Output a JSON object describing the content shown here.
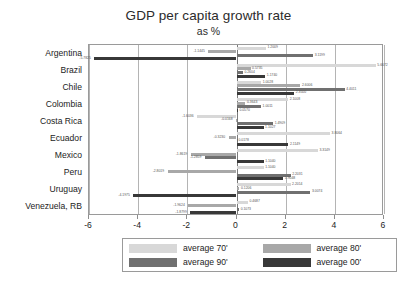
{
  "chart": {
    "title": "GDP per capita growth rate",
    "subtitle": "as %"
  },
  "legend": {
    "items": [
      {
        "label": "average 70'",
        "color": "#d8d8d8"
      },
      {
        "label": "average 80'",
        "color": "#a8a8a8"
      },
      {
        "label": "average 90'",
        "color": "#707070"
      },
      {
        "label": "average 00'",
        "color": "#383838"
      }
    ]
  },
  "chart_data": {
    "type": "bar",
    "orientation": "horizontal",
    "title": "GDP per capita growth rate",
    "subtitle": "as %",
    "xlabel": "",
    "ylabel": "",
    "xlim": [
      -6,
      6
    ],
    "xticks": [
      -6,
      -4,
      -2,
      0,
      2,
      4,
      6
    ],
    "xticklabels": [
      "-6",
      "-4",
      "-2",
      "0",
      "2",
      "4",
      "6"
    ],
    "grid": true,
    "legend_position": "bottom",
    "categories": [
      "Argentina",
      "Brazil",
      "Chile",
      "Colombia",
      "Costa Rica",
      "Ecuador",
      "Mexico",
      "Peru",
      "Uruguay",
      "Venezuela, RB"
    ],
    "series": [
      {
        "name": "average 70'",
        "color": "#d8d8d8",
        "values": [
          1.2009,
          5.6672,
          1.0028,
          2.1008,
          -1.6036,
          3.8064,
          3.3149,
          1.104,
          2.2014,
          0.4687
        ]
      },
      {
        "name": "average 80'",
        "color": "#a8a8a8",
        "values": [
          -1.1445,
          0.5735,
          2.6006,
          0.3643,
          -0.0168,
          -0.323,
          -1.8619,
          -2.8019,
          0.1206,
          -1.9624
        ]
      },
      {
        "name": "average 90'",
        "color": "#707070",
        "values": [
          3.1199,
          0.2604,
          4.4011,
          1.0011,
          1.4909,
          0.0178,
          -1.2859,
          2.2031,
          3.0074,
          0.1073
        ]
      },
      {
        "name": "average 00'",
        "color": "#383838",
        "values": [
          -5.7825,
          1.174,
          2.35,
          0.057,
          1.1027,
          2.1149,
          1.104,
          1.9048,
          -4.1975,
          -1.8799
        ]
      }
    ],
    "value_labels": [
      {
        "category": "Argentina",
        "series": "average 70'",
        "text": "1.2009"
      },
      {
        "category": "Argentina",
        "series": "average 80'",
        "text": "-1.1445"
      },
      {
        "category": "Argentina",
        "series": "average 90'",
        "text": "3.1199"
      },
      {
        "category": "Argentina",
        "series": "average 00'",
        "text": "-5.7825"
      },
      {
        "category": "Brazil",
        "series": "average 70'",
        "text": "5.6672"
      },
      {
        "category": "Brazil",
        "series": "average 80'",
        "text": "0.5735"
      },
      {
        "category": "Brazil",
        "series": "average 90'",
        "text": "0.2604"
      },
      {
        "category": "Brazil",
        "series": "average 00'",
        "text": "1.1740"
      },
      {
        "category": "Chile",
        "series": "average 70'",
        "text": "1.0028"
      },
      {
        "category": "Chile",
        "series": "average 80'",
        "text": "2.6006"
      },
      {
        "category": "Chile",
        "series": "average 90'",
        "text": "4.4011"
      },
      {
        "category": "Chile",
        "series": "average 00'",
        "text": "2.3500"
      },
      {
        "category": "Colombia",
        "series": "average 70'",
        "text": "2.1008"
      },
      {
        "category": "Colombia",
        "series": "average 80'",
        "text": "0.3643"
      },
      {
        "category": "Colombia",
        "series": "average 90'",
        "text": "1.0011"
      },
      {
        "category": "Colombia",
        "series": "average 00'",
        "text": "0.0570"
      },
      {
        "category": "Costa Rica",
        "series": "average 70'",
        "text": "-1.6036"
      },
      {
        "category": "Costa Rica",
        "series": "average 80'",
        "text": "-0.0168"
      },
      {
        "category": "Costa Rica",
        "series": "average 90'",
        "text": "1.4909"
      },
      {
        "category": "Costa Rica",
        "series": "average 00'",
        "text": "1.1027"
      },
      {
        "category": "Ecuador",
        "series": "average 70'",
        "text": "3.8064"
      },
      {
        "category": "Ecuador",
        "series": "average 80'",
        "text": "-0.3230"
      },
      {
        "category": "Ecuador",
        "series": "average 90'",
        "text": "0.0178"
      },
      {
        "category": "Ecuador",
        "series": "average 00'",
        "text": "2.1149"
      },
      {
        "category": "Mexico",
        "series": "average 70'",
        "text": "3.3149"
      },
      {
        "category": "Mexico",
        "series": "average 80'",
        "text": "-1.8619"
      },
      {
        "category": "Mexico",
        "series": "average 90'",
        "text": "-1.2859"
      },
      {
        "category": "Mexico",
        "series": "average 00'",
        "text": "1.1040"
      },
      {
        "category": "Peru",
        "series": "average 70'",
        "text": "1.1040"
      },
      {
        "category": "Peru",
        "series": "average 80'",
        "text": "-2.8019"
      },
      {
        "category": "Peru",
        "series": "average 90'",
        "text": "2.2031"
      },
      {
        "category": "Peru",
        "series": "average 00'",
        "text": "1.9048"
      },
      {
        "category": "Uruguay",
        "series": "average 70'",
        "text": "2.2014"
      },
      {
        "category": "Uruguay",
        "series": "average 80'",
        "text": "0.1206"
      },
      {
        "category": "Uruguay",
        "series": "average 90'",
        "text": "3.0074"
      },
      {
        "category": "Uruguay",
        "series": "average 00'",
        "text": "-4.1975"
      },
      {
        "category": "Venezuela, RB",
        "series": "average 70'",
        "text": "0.4687"
      },
      {
        "category": "Venezuela, RB",
        "series": "average 80'",
        "text": "-1.9624"
      },
      {
        "category": "Venezuela, RB",
        "series": "average 90'",
        "text": "0.1073"
      },
      {
        "category": "Venezuela, RB",
        "series": "average 00'",
        "text": "-1.8799"
      }
    ]
  }
}
